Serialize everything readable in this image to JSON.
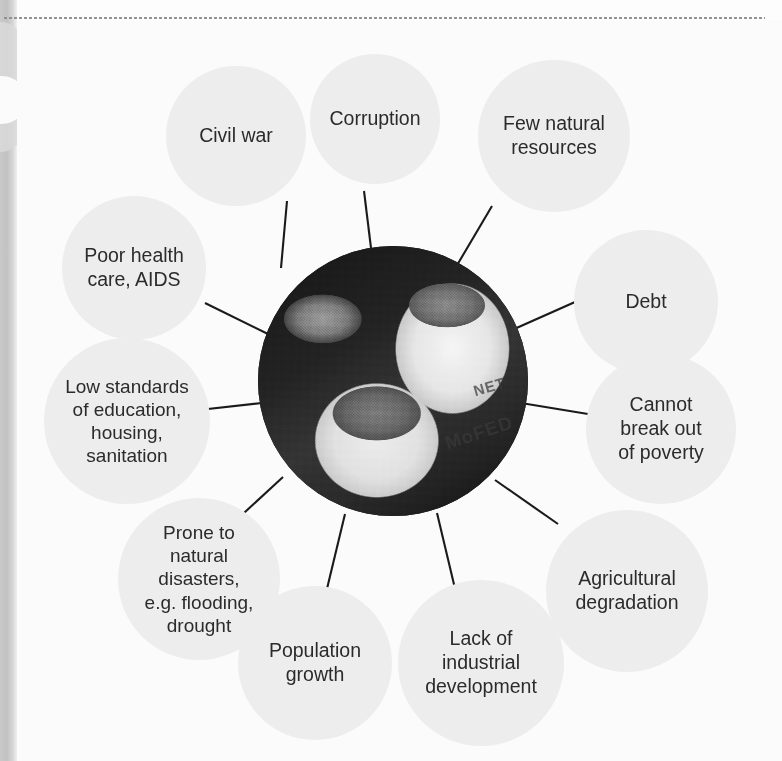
{
  "diagram": {
    "type": "hub-and-spoke",
    "center": {
      "name": "central-photo",
      "description": "Black and white photograph of open sacks filled with grain, with a dark pot behind",
      "sack_text_1": "NET",
      "sack_text_2": "MoFED"
    },
    "bubble_fill_color": "#ededed",
    "text_color": "#2b2b2b",
    "connector_color": "#1a1a1a",
    "background_color": "#fbfbfb",
    "nodes": [
      {
        "id": "civil-war",
        "label": "Civil war"
      },
      {
        "id": "corruption",
        "label": "Corruption"
      },
      {
        "id": "few-resources",
        "label": "Few natural\nresources"
      },
      {
        "id": "debt",
        "label": "Debt"
      },
      {
        "id": "cannot-break-out",
        "label": "Cannot\nbreak out\nof poverty"
      },
      {
        "id": "agricultural-degradation",
        "label": "Agricultural\ndegradation"
      },
      {
        "id": "lack-industrial",
        "label": "Lack of\nindustrial\ndevelopment"
      },
      {
        "id": "population-growth",
        "label": "Population\ngrowth"
      },
      {
        "id": "natural-disasters",
        "label": "Prone to\nnatural\ndisasters,\ne.g. flooding,\ndrought"
      },
      {
        "id": "low-standards",
        "label": "Low standards\nof education,\nhousing,\nsanitation"
      },
      {
        "id": "poor-health",
        "label": "Poor health\ncare, AIDS"
      }
    ]
  }
}
